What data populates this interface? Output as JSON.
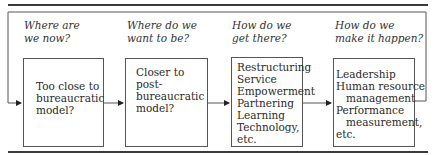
{
  "diagram": {
    "type": "flow",
    "columns": [
      {
        "question_lines": [
          "Where are",
          "we now?"
        ],
        "box_lines": [
          {
            "text": "Too close to",
            "indent": false
          },
          {
            "text": "bureaucratic",
            "indent": false
          },
          {
            "text": "model?",
            "indent": false
          }
        ]
      },
      {
        "question_lines": [
          "Where do we",
          "want to be?"
        ],
        "box_lines": [
          {
            "text": "Closer to",
            "indent": false
          },
          {
            "text": "post-",
            "indent": false
          },
          {
            "text": "bureaucratic",
            "indent": false
          },
          {
            "text": "model?",
            "indent": false
          }
        ]
      },
      {
        "question_lines": [
          "How do we",
          "get there?"
        ],
        "box_lines": [
          {
            "text": "Restructuring",
            "indent": false
          },
          {
            "text": "Service",
            "indent": false
          },
          {
            "text": "Empowerment",
            "indent": false
          },
          {
            "text": "Partnering",
            "indent": false
          },
          {
            "text": "Learning",
            "indent": false
          },
          {
            "text": "Technology,",
            "indent": false
          },
          {
            "text": "etc.",
            "indent": false
          }
        ]
      },
      {
        "question_lines": [
          "How do we",
          "make it happen?"
        ],
        "box_lines": [
          {
            "text": "Leadership",
            "indent": false
          },
          {
            "text": "Human resource",
            "indent": false
          },
          {
            "text": "management",
            "indent": true
          },
          {
            "text": "Performance",
            "indent": false
          },
          {
            "text": "measurement,",
            "indent": true
          },
          {
            "text": "etc.",
            "indent": false
          }
        ]
      }
    ],
    "colors": {
      "line": "#555555",
      "rule": "#3a3a3a",
      "text": "#2a2a2a"
    }
  }
}
